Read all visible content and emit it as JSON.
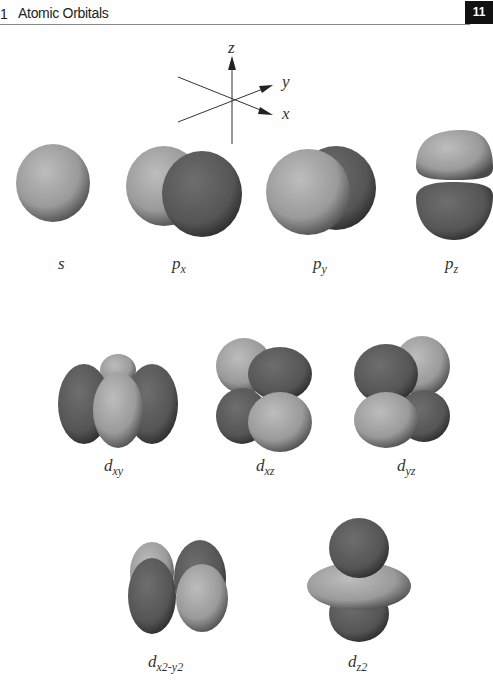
{
  "header": {
    "chapter_number": "1",
    "title": "Atomic Orbitals",
    "page_number": "11"
  },
  "axes": {
    "z": "z",
    "y": "y",
    "x": "x"
  },
  "orbitals": {
    "s": {
      "label": "s"
    },
    "px": {
      "label_main": "p",
      "label_sub": "x"
    },
    "py": {
      "label_main": "p",
      "label_sub": "y"
    },
    "pz": {
      "label_main": "p",
      "label_sub": "z"
    },
    "dxy": {
      "label_main": "d",
      "label_sub": "xy"
    },
    "dxz": {
      "label_main": "d",
      "label_sub": "xz"
    },
    "dyz": {
      "label_main": "d",
      "label_sub": "yz"
    },
    "dx2y2": {
      "label_main": "d",
      "label_sub": "x2-y2"
    },
    "dz2": {
      "label_main": "d",
      "label_sub": "z2"
    }
  },
  "colors": {
    "light_lobe": "#a8a8a8",
    "dark_lobe": "#555555"
  }
}
